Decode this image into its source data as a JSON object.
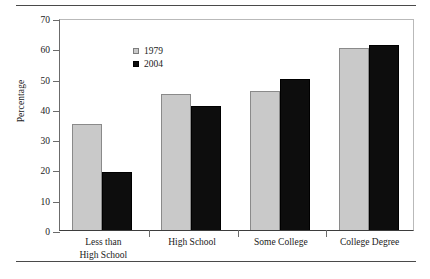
{
  "chart_data": {
    "type": "bar",
    "title": "",
    "subtitle": "",
    "xlabel": "",
    "ylabel": "Percentage",
    "ylim": [
      0,
      70
    ],
    "yticks": [
      0,
      10,
      20,
      30,
      40,
      50,
      60,
      70
    ],
    "ytick_labels": [
      "0",
      "10",
      "20",
      "30",
      "40",
      "50",
      "60",
      "70"
    ],
    "grid": false,
    "legend_position": "top-left",
    "categories": [
      "Less than\nHigh School",
      "High School",
      "Some College",
      "College Degree"
    ],
    "series": [
      {
        "name": "1979",
        "color": "#c9c9c9",
        "values": [
          35,
          45,
          46,
          60
        ]
      },
      {
        "name": "2004",
        "color": "#0d0d0d",
        "values": [
          19,
          41,
          50,
          61
        ]
      }
    ],
    "annotations": []
  },
  "legend": {
    "entries": [
      {
        "label": "1979",
        "swatch": "light-gray-square"
      },
      {
        "label": "2004",
        "swatch": "black-square"
      }
    ]
  },
  "rules": {
    "top": "horizontal-rule",
    "bottom": "horizontal-rule"
  }
}
